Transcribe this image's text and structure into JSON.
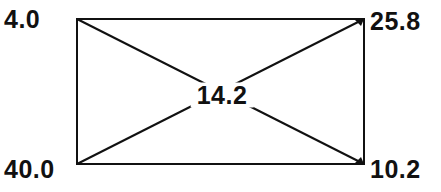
{
  "diagram": {
    "type": "rectangle-with-diagonals",
    "corners": {
      "top_left": {
        "label": "4.0"
      },
      "top_right": {
        "label": "25.8"
      },
      "bottom_left": {
        "label": "40.0"
      },
      "bottom_right": {
        "label": "10.2"
      }
    },
    "center": {
      "label": "14.2"
    },
    "colors": {
      "line": "#111111",
      "text": "#111111",
      "background": "#ffffff"
    }
  }
}
